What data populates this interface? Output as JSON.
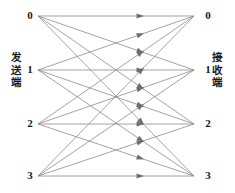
{
  "figure": {
    "type": "bipartite-channel-diagram",
    "width": 235,
    "height": 193,
    "background_color": "#ffffff",
    "edge_color": "#8c8c8c",
    "arrow_color": "#6e6e6e",
    "label_color": "#1a1a1a"
  },
  "captions": {
    "left": {
      "text": "发送端",
      "chars": [
        "发",
        "送",
        "端"
      ]
    },
    "right": {
      "text": "接收端",
      "chars": [
        "接",
        "收",
        "端"
      ]
    }
  },
  "chart_data": {
    "type": "diagram",
    "title": "",
    "subtitle": "",
    "xlabel": "",
    "ylabel": "",
    "legend_position": "none",
    "grid": false,
    "graph_kind": "complete bipartite digraph K(4,4)",
    "edge_count": 16,
    "direction": "left-to-right",
    "left_nodes": [
      {
        "label": "0",
        "index": 0,
        "x": 38,
        "y": 16
      },
      {
        "label": "1",
        "index": 1,
        "x": 38,
        "y": 70
      },
      {
        "label": "2",
        "index": 2,
        "x": 38,
        "y": 124
      },
      {
        "label": "3",
        "index": 3,
        "x": 38,
        "y": 176
      }
    ],
    "right_nodes": [
      {
        "label": "0",
        "index": 0,
        "x": 194,
        "y": 16
      },
      {
        "label": "1",
        "index": 1,
        "x": 194,
        "y": 70
      },
      {
        "label": "2",
        "index": 2,
        "x": 194,
        "y": 124
      },
      {
        "label": "3",
        "index": 3,
        "x": 194,
        "y": 176
      }
    ],
    "edges": [
      {
        "from": 0,
        "to": 0
      },
      {
        "from": 0,
        "to": 1
      },
      {
        "from": 0,
        "to": 2
      },
      {
        "from": 0,
        "to": 3
      },
      {
        "from": 1,
        "to": 0
      },
      {
        "from": 1,
        "to": 1
      },
      {
        "from": 1,
        "to": 2
      },
      {
        "from": 1,
        "to": 3
      },
      {
        "from": 2,
        "to": 0
      },
      {
        "from": 2,
        "to": 1
      },
      {
        "from": 2,
        "to": 2
      },
      {
        "from": 2,
        "to": 3
      },
      {
        "from": 3,
        "to": 0
      },
      {
        "from": 3,
        "to": 1
      },
      {
        "from": 3,
        "to": 2
      },
      {
        "from": 3,
        "to": 3
      }
    ],
    "arrow_position_fraction": 0.68
  }
}
